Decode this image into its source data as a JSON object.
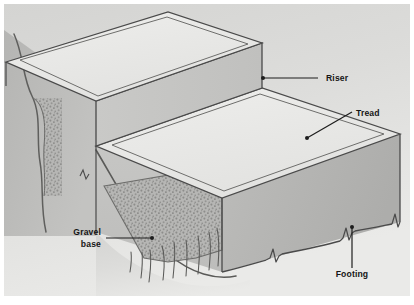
{
  "figure": {
    "type": "isometric-cutaway-diagram",
    "background_color": "#ffffff",
    "canvas": {
      "width": 414,
      "height": 305
    }
  },
  "palette": {
    "page_background": "#ffffff",
    "scene_background_top": "#d8d8d6",
    "scene_background_bottom": "#e6e6e4",
    "tread_top_face": "#e9e9e7",
    "upper_tread_top_face": "#ececea",
    "riser_face": "#c6c6c4",
    "front_face": "#c2c2c0",
    "side_face": "#b0b0ae",
    "soil_fill": "#b9b9b7",
    "gravel_fill": "#b4b4b2",
    "gravel_speckle": "#8e8e8c",
    "outline": "#4a4a4a",
    "label_text": "#151515",
    "leader_line": "#1d1d1d"
  },
  "labels": [
    {
      "id": "riser",
      "text": "Riser",
      "lines": [
        "Riser"
      ],
      "text_anchor": "start",
      "text_x": 326,
      "text_y": 81,
      "leader": {
        "type": "straight",
        "points": "318,78 263,78"
      },
      "dot": {
        "cx": 263,
        "cy": 78,
        "r": 2.0
      }
    },
    {
      "id": "tread",
      "text": "Tread",
      "lines": [
        "Tread"
      ],
      "text_anchor": "start",
      "text_x": 356,
      "text_y": 116,
      "leader": {
        "type": "straight",
        "points": "352,113 307,138"
      },
      "dot": {
        "cx": 307,
        "cy": 138,
        "r": 2.0
      }
    },
    {
      "id": "gravel-base",
      "text": "Gravel base",
      "lines": [
        "Gravel",
        "base"
      ],
      "text_anchor": "end",
      "text_x": 101,
      "text_y": 238,
      "leader": {
        "type": "straight",
        "points": "106,238 153,238"
      },
      "dot": {
        "cx": 153,
        "cy": 238,
        "r": 2.0
      }
    },
    {
      "id": "footing",
      "text": "Footing",
      "lines": [
        "Footing"
      ],
      "text_anchor": "middle",
      "text_x": 352,
      "text_y": 277,
      "leader": {
        "type": "straight",
        "points": "352,268 352,228"
      },
      "dot": {
        "cx": 352,
        "cy": 227,
        "r": 2.0
      }
    }
  ],
  "geometry": {
    "scene_frame": {
      "x": 4,
      "y": 4,
      "width": 406,
      "height": 292
    },
    "upper_tread_top": "6,62 168,12 262,43 96,101",
    "upper_tread_inset": "24,61 168,17 249,44 100,95",
    "riser_face": "96,101 262,43 262,88 96,146",
    "riser_bottom_edge": "96,146 262,88",
    "lower_tread_top": "96,146 262,88 400,134 222,198",
    "lower_tread_inset": "112,144 258,94 384,134 224,192",
    "front_face_left_x": 96,
    "front_face": "96,146 96,232 222,272 222,198",
    "right_face": "222,198 400,134 400,222 222,272",
    "soil_cut_left": "4,36 96,101 96,232 4,232",
    "gravel_pocket": "104,186 222,166 222,248 150,262",
    "footing_break_line": "222,262 268,256 300,250 352,244 400,236"
  },
  "annotations": {
    "break_marks": 3,
    "soil_hatch_lines": 9,
    "gravel_speckle_count": 170
  }
}
